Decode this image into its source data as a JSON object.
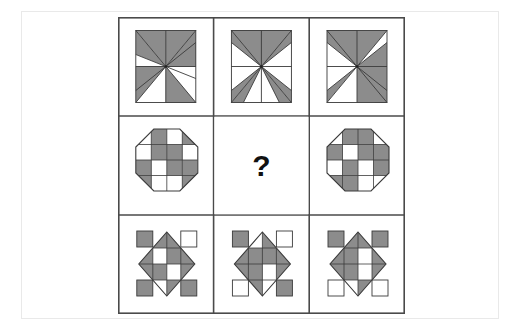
{
  "canvas": {
    "width": 521,
    "height": 331,
    "background": "#ffffff"
  },
  "outer_frame": {
    "border_color": "#e9e9e9",
    "x": 21,
    "y": 11,
    "width": 478,
    "height": 308
  },
  "matrix": {
    "rows": 3,
    "cols": 3,
    "x": 118,
    "y": 17,
    "width": 287,
    "height": 297,
    "cell_width": 95.6,
    "cell_height": 99,
    "border_color": "#4a4a4a",
    "border_width": 1.6,
    "fill_color": "#8c8c8c",
    "line_color": "#3a3a3a",
    "empty_color": "#ffffff"
  },
  "missing_cell": {
    "row": 1,
    "col": 1,
    "label": "?"
  },
  "cells": [
    {
      "id": "cell-r1c1",
      "row": 0,
      "col": 0,
      "shape": "pinwheel-square",
      "description": "Square divided into four quadrants, each quadrant containing a shaded triangular pinwheel blade with a white star-point notch",
      "quadrants": [
        "shaded",
        "shaded",
        "shaded",
        "shaded"
      ],
      "notch_corners": [
        "left",
        "right",
        "left",
        "right"
      ]
    },
    {
      "id": "cell-r1c2",
      "row": 0,
      "col": 1,
      "shape": "pinwheel-square",
      "description": "Square pinwheel, four shaded blades with white four-point star in the centre",
      "quadrants": [
        "shaded",
        "shaded",
        "shaded",
        "shaded"
      ],
      "notch_corners": [
        "left",
        "right",
        "left",
        "right"
      ]
    },
    {
      "id": "cell-r1c3",
      "row": 0,
      "col": 2,
      "shape": "pinwheel-square",
      "description": "Square pinwheel with two opposite quadrants lightened, producing a diagonal contrast",
      "quadrants": [
        "shaded",
        "white",
        "white",
        "shaded"
      ],
      "notch_corners": [
        "left",
        "right",
        "left",
        "right"
      ]
    },
    {
      "id": "cell-r2c1",
      "row": 1,
      "col": 0,
      "shape": "octagon-checker",
      "description": "Octagon containing a 4x4 checkerboard of shaded and white squares",
      "checker": [
        [
          "white",
          "shaded",
          "white",
          "shaded"
        ],
        [
          "white",
          "shaded",
          "shaded",
          "white"
        ],
        [
          "shaded",
          "white",
          "shaded",
          "shaded"
        ],
        [
          "shaded",
          "white",
          "white",
          "shaded"
        ]
      ]
    },
    {
      "id": "cell-r2c2",
      "row": 1,
      "col": 1,
      "shape": "missing",
      "description": "Blank cell containing a question mark — the answer to be deduced"
    },
    {
      "id": "cell-r2c3",
      "row": 1,
      "col": 2,
      "shape": "octagon-checker",
      "description": "Octagon containing a 4x4 checkerboard, offset one step from the left octagon",
      "checker": [
        [
          "white",
          "shaded",
          "shaded",
          "white"
        ],
        [
          "shaded",
          "white",
          "shaded",
          "shaded"
        ],
        [
          "white",
          "shaded",
          "white",
          "shaded"
        ],
        [
          "shaded",
          "shaded",
          "white",
          "white"
        ]
      ]
    },
    {
      "id": "cell-r3c1",
      "row": 2,
      "col": 0,
      "shape": "diamond-corners",
      "description": "Shaded diamond with an internal cross of white cells, flanked by four corner squares",
      "corners": {
        "top_left": "shaded",
        "top_right": "white",
        "bottom_left": "shaded",
        "bottom_right": "shaded"
      },
      "diamond_cells": [
        [
          "white",
          "shaded"
        ],
        [
          "shaded",
          "white"
        ]
      ]
    },
    {
      "id": "cell-r3c2",
      "row": 2,
      "col": 1,
      "shape": "diamond-corners",
      "description": "Shaded diamond with internal white cells, corner squares rotated one position",
      "corners": {
        "top_left": "shaded",
        "top_right": "white",
        "bottom_left": "white",
        "bottom_right": "shaded"
      },
      "diamond_cells": [
        [
          "shaded",
          "shaded"
        ],
        [
          "shaded",
          "white"
        ]
      ]
    },
    {
      "id": "cell-r3c3",
      "row": 2,
      "col": 2,
      "shape": "diamond-corners",
      "description": "Shaded diamond with internal white cells, both top corner squares shaded and both bottom corners white",
      "corners": {
        "top_left": "shaded",
        "top_right": "shaded",
        "bottom_left": "white",
        "bottom_right": "white"
      },
      "diamond_cells": [
        [
          "shaded",
          "white"
        ],
        [
          "shaded",
          "shaded"
        ]
      ]
    }
  ]
}
